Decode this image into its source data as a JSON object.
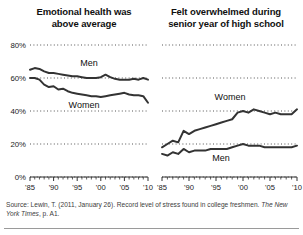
{
  "figure": {
    "background": "#ffffff",
    "rule_color": "#9a9a9a"
  },
  "panels": {
    "left": {
      "title_line1": "Emotional health was",
      "title_line2": "above average"
    },
    "right": {
      "title_line1": "Felt overwhelmed during",
      "title_line2": "senior year of high school"
    }
  },
  "axis": {
    "y_ticks": [
      "80%",
      "60%",
      "40%",
      "20%",
      "0%"
    ],
    "y_values": [
      80,
      60,
      40,
      20,
      0
    ],
    "x_ticks": [
      "'85",
      "'90",
      "'95",
      "'00",
      "'05",
      "'10"
    ],
    "x_values": [
      1985,
      1990,
      1995,
      2000,
      2005,
      2010
    ]
  },
  "series_labels": {
    "left_men": "Men",
    "left_women": "Women",
    "right_women": "Women",
    "right_men": "Men"
  },
  "source": {
    "text_before": "Source: Lewin, T. (2011, January 26). Record level of stress found in college freshmen. ",
    "italic": "The New York Times",
    "text_after": ", p. A1."
  },
  "chart_data": [
    {
      "type": "line",
      "id": "emotional-health-above-average",
      "title": "Emotional health was above average",
      "xlabel": "",
      "ylabel": "",
      "xlim": [
        1985,
        2010
      ],
      "ylim": [
        0,
        80
      ],
      "grid": true,
      "grid_style": "dotted-horizontal",
      "legend": "inline-labels",
      "line_color": "#333333",
      "series": [
        {
          "name": "Men",
          "x": [
            1985,
            1986,
            1987,
            1988,
            1989,
            1990,
            1991,
            1992,
            1993,
            1994,
            1995,
            1996,
            1997,
            1998,
            1999,
            2000,
            2001,
            2002,
            2003,
            2004,
            2005,
            2006,
            2007,
            2008,
            2009,
            2010
          ],
          "values": [
            65,
            66,
            65.5,
            64,
            63,
            63,
            62.5,
            62,
            61.5,
            61,
            61,
            60.5,
            60,
            60,
            60,
            60.5,
            62,
            60.5,
            59.5,
            59,
            59,
            59,
            59.5,
            59,
            60,
            59
          ]
        },
        {
          "name": "Women",
          "x": [
            1985,
            1986,
            1987,
            1988,
            1989,
            1990,
            1991,
            1992,
            1993,
            1994,
            1995,
            1996,
            1997,
            1998,
            1999,
            2000,
            2001,
            2002,
            2003,
            2004,
            2005,
            2006,
            2007,
            2008,
            2009,
            2010
          ],
          "values": [
            60,
            60,
            59,
            56,
            54.5,
            55,
            53,
            53.5,
            52,
            51,
            50.5,
            50,
            49.5,
            49,
            49,
            48.5,
            49,
            49.5,
            50,
            50.5,
            51,
            50,
            49.5,
            49.5,
            49,
            45
          ]
        }
      ]
    },
    {
      "type": "line",
      "id": "felt-overwhelmed-senior-year",
      "title": "Felt overwhelmed during senior year of high school",
      "xlabel": "",
      "ylabel": "",
      "xlim": [
        1985,
        2010
      ],
      "ylim": [
        0,
        80
      ],
      "grid": true,
      "grid_style": "dotted-horizontal",
      "legend": "inline-labels",
      "line_color": "#333333",
      "series": [
        {
          "name": "Women",
          "x": [
            1985,
            1986,
            1987,
            1988,
            1989,
            1990,
            1991,
            1992,
            1993,
            1994,
            1995,
            1996,
            1997,
            1998,
            1999,
            2000,
            2001,
            2002,
            2003,
            2004,
            2005,
            2006,
            2007,
            2008,
            2009,
            2010
          ],
          "values": [
            18,
            20,
            22,
            21,
            28,
            26,
            28,
            29,
            30,
            31,
            32,
            33,
            34,
            35,
            39,
            40,
            39,
            41,
            40,
            39,
            38,
            39,
            38,
            38,
            38,
            41
          ]
        },
        {
          "name": "Men",
          "x": [
            1985,
            1986,
            1987,
            1988,
            1989,
            1990,
            1991,
            1992,
            1993,
            1994,
            1995,
            1996,
            1997,
            1998,
            1999,
            2000,
            2001,
            2002,
            2003,
            2004,
            2005,
            2006,
            2007,
            2008,
            2009,
            2010
          ],
          "values": [
            14,
            13,
            15,
            14,
            17,
            15,
            16,
            16,
            16,
            17,
            17,
            17,
            17,
            18,
            19,
            20,
            19,
            19,
            19,
            18,
            18,
            18,
            18,
            18,
            18,
            19
          ]
        }
      ]
    }
  ]
}
